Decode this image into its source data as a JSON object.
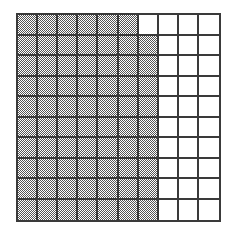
{
  "figure": {
    "kind": "hundredths-grid",
    "rows": 10,
    "columns": 10,
    "total_cells": 100,
    "shaded_cells": 69,
    "unshaded_cells": 31,
    "fraction": "69/100",
    "decimal": "0.69",
    "percent": "69%"
  },
  "colors": {
    "shaded": "#555555",
    "unshaded": "#ffffff",
    "gridline": "#3a3a3a",
    "background": "#ffffff"
  },
  "chart_data": {
    "type": "heatmap",
    "title": "",
    "subtitle": "",
    "xlabel": "",
    "ylabel": "",
    "x": [
      1,
      2,
      3,
      4,
      5,
      6,
      7,
      8,
      9,
      10
    ],
    "categories": [
      "1",
      "2",
      "3",
      "4",
      "5",
      "6",
      "7",
      "8",
      "9",
      "10"
    ],
    "row_labels": [
      "1",
      "2",
      "3",
      "4",
      "5",
      "6",
      "7",
      "8",
      "9",
      "10"
    ],
    "grid": true,
    "legend": "none",
    "value_meaning": "1 = shaded square, 0 = unshaded square",
    "shaded_per_row": [
      6,
      7,
      7,
      7,
      7,
      7,
      7,
      7,
      7,
      7
    ],
    "values": [
      [
        1,
        1,
        1,
        1,
        1,
        1,
        0,
        0,
        0,
        0
      ],
      [
        1,
        1,
        1,
        1,
        1,
        1,
        1,
        0,
        0,
        0
      ],
      [
        1,
        1,
        1,
        1,
        1,
        1,
        1,
        0,
        0,
        0
      ],
      [
        1,
        1,
        1,
        1,
        1,
        1,
        1,
        0,
        0,
        0
      ],
      [
        1,
        1,
        1,
        1,
        1,
        1,
        1,
        0,
        0,
        0
      ],
      [
        1,
        1,
        1,
        1,
        1,
        1,
        1,
        0,
        0,
        0
      ],
      [
        1,
        1,
        1,
        1,
        1,
        1,
        1,
        0,
        0,
        0
      ],
      [
        1,
        1,
        1,
        1,
        1,
        1,
        1,
        0,
        0,
        0
      ],
      [
        1,
        1,
        1,
        1,
        1,
        1,
        1,
        0,
        0,
        0
      ],
      [
        1,
        1,
        1,
        1,
        1,
        1,
        1,
        0,
        0,
        0
      ]
    ]
  }
}
